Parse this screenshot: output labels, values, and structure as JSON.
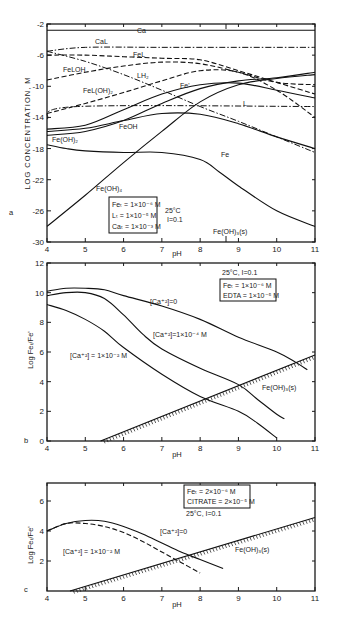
{
  "chart_data": [
    {
      "panel": "a",
      "type": "line",
      "xlabel": "pH",
      "ylabel": "LOG CONCENTRATION, M",
      "xlim": [
        4,
        11
      ],
      "ylim": [
        -30,
        -2
      ],
      "xticks": [
        "4",
        "5",
        "6",
        "7",
        "8",
        "9",
        "10",
        "11"
      ],
      "yticks": [
        "-2",
        "-6",
        "-10",
        "-14",
        "-18",
        "-22",
        "-26",
        "-30"
      ],
      "annotation_box": [
        "Fe_T = 1×10^-6 M",
        "L_T = 1×10^-5 M",
        "Ca_T = 1×10^-3 M"
      ],
      "conditions": [
        "25°C",
        "I=0.1"
      ],
      "marker": {
        "label": "Fe(OH)3(s)",
        "x": 8.6
      },
      "series": [
        {
          "name": "Ca",
          "style": "solid",
          "x": [
            4,
            11
          ],
          "y": [
            -2.8,
            -2.8
          ]
        },
        {
          "name": "CaL",
          "style": "dashdot",
          "x": [
            4,
            5,
            7,
            9,
            11
          ],
          "y": [
            -5.5,
            -5.0,
            -5.0,
            -5.0,
            -5.0
          ]
        },
        {
          "name": "FeL",
          "style": "dash",
          "x": [
            4,
            5,
            6,
            7,
            8,
            9,
            10,
            11
          ],
          "y": [
            -6,
            -6,
            -6.2,
            -6.4,
            -6.6,
            -8,
            -9.5,
            -11
          ]
        },
        {
          "name": "FeLOH",
          "style": "dash",
          "x": [
            4,
            5,
            6,
            7,
            8,
            9,
            10,
            11
          ],
          "y": [
            -9.2,
            -8.2,
            -7.4,
            -6.9,
            -7.1,
            -8.2,
            -9.5,
            -9.8
          ]
        },
        {
          "name": "LH2",
          "style": "dashdot",
          "x": [
            4,
            5,
            6,
            7,
            8,
            9,
            10,
            11
          ],
          "y": [
            -5.5,
            -6.8,
            -8.5,
            -10.5,
            -12.6,
            -14.5,
            -16.5,
            -18.5
          ]
        },
        {
          "name": "FeL(OH)2",
          "style": "dash",
          "x": [
            4,
            5,
            6,
            7,
            8,
            9,
            10,
            11
          ],
          "y": [
            -13.5,
            -12.2,
            -10.8,
            -9.3,
            -8,
            -8.2,
            -10.5,
            -14
          ]
        },
        {
          "name": "L",
          "style": "dashdot",
          "x": [
            4,
            4.8,
            11
          ],
          "y": [
            -14.2,
            -12.6,
            -12.6
          ]
        },
        {
          "name": "Fe'",
          "style": "solid",
          "x": [
            4,
            5,
            6,
            7,
            8,
            9,
            10,
            11
          ],
          "y": [
            -15.5,
            -15,
            -13,
            -11,
            -9.8,
            -9.6,
            -10.5,
            -11.5
          ]
        },
        {
          "name": "FeOH",
          "style": "solid",
          "x": [
            4,
            5,
            6,
            7,
            8,
            9,
            10,
            11
          ],
          "y": [
            -15.8,
            -15.4,
            -14.4,
            -13.5,
            -13.6,
            -14.8,
            -16.5,
            -18
          ]
        },
        {
          "name": "Fe(OH)2",
          "style": "solid",
          "x": [
            4,
            5,
            6,
            7,
            8,
            9,
            10,
            11
          ],
          "y": [
            -16.3,
            -15.8,
            -14.4,
            -12.2,
            -10.3,
            -9.3,
            -8.9,
            -8.2
          ]
        },
        {
          "name": "Fe",
          "style": "solid",
          "x": [
            4,
            4.5,
            5,
            6,
            7,
            8,
            8.5,
            9,
            10,
            11
          ],
          "y": [
            -17.5,
            -18,
            -18.3,
            -18.5,
            -18.5,
            -19.4,
            -21,
            -22.8,
            -26,
            -28
          ]
        },
        {
          "name": "Fe(OH)4",
          "style": "solid",
          "x": [
            4,
            5,
            6,
            7,
            8,
            9,
            10,
            11
          ],
          "y": [
            -28,
            -24,
            -19.8,
            -15.8,
            -12,
            -9.8,
            -9,
            -8.5
          ]
        }
      ]
    },
    {
      "panel": "b",
      "type": "line",
      "xlabel": "pH",
      "ylabel": "Log Fe_T/Fe'",
      "xlim": [
        4,
        11
      ],
      "ylim": [
        0,
        12
      ],
      "xticks": [
        "4",
        "5",
        "6",
        "7",
        "8",
        "9",
        "10",
        "11"
      ],
      "yticks": [
        "0",
        "2",
        "4",
        "6",
        "8",
        "10",
        "12"
      ],
      "conditions": "25°C, I=0.1",
      "annotation_box": [
        "Fe_T = 1×10^-6 M",
        "EDTA = 1×10^-5 M"
      ],
      "series": [
        {
          "name": "[Ca+2]=0",
          "style": "solid",
          "x": [
            4,
            4.5,
            5,
            5.5,
            6,
            7,
            8,
            9,
            10,
            10.5,
            10.8
          ],
          "y": [
            10.1,
            10.3,
            10.3,
            10.2,
            9.8,
            9.1,
            8.2,
            7.0,
            6.0,
            5.3,
            4.8
          ]
        },
        {
          "name": "[Ca+2]=1×10^-4 M",
          "style": "solid",
          "x": [
            4,
            4.5,
            5,
            5.5,
            6,
            6.5,
            7,
            8,
            9,
            9.5,
            10,
            10.2
          ],
          "y": [
            9.8,
            10.0,
            10.0,
            9.6,
            8.5,
            7.2,
            6.2,
            4.9,
            3.8,
            2.8,
            1.8,
            1.5
          ]
        },
        {
          "name": "[Ca+2]=1×10^-2 M",
          "style": "solid",
          "x": [
            4,
            4.5,
            5,
            5.5,
            6,
            7,
            8,
            9,
            9.5,
            10
          ],
          "y": [
            9.2,
            8.8,
            8.2,
            7.4,
            6.3,
            4.5,
            3.0,
            2.0,
            1.2,
            0.2
          ]
        },
        {
          "name": "Fe(OH)3(s)",
          "style": "hatched",
          "x": [
            5.4,
            11
          ],
          "y": [
            0,
            5.8
          ]
        }
      ]
    },
    {
      "panel": "c",
      "type": "line",
      "xlabel": "pH",
      "ylabel": "Log Fe_T/Fe'",
      "xlim": [
        4,
        11
      ],
      "ylim": [
        0,
        7.2
      ],
      "xticks": [
        "4",
        "5",
        "6",
        "7",
        "8",
        "9",
        "10",
        "11"
      ],
      "yticks": [
        "2",
        "4",
        "6"
      ],
      "annotation_box": [
        "Fe_T = 2×10^-6 M",
        "CITRATE = 2×10^-5 M"
      ],
      "conditions": "25°C, I=0.1",
      "series": [
        {
          "name": "[Ca+2]=0",
          "style": "solid",
          "x": [
            4,
            4.5,
            5,
            5.5,
            6,
            6.5,
            7,
            7.5,
            8,
            8.6
          ],
          "y": [
            4.0,
            4.5,
            4.7,
            4.65,
            4.3,
            3.8,
            3.2,
            2.6,
            2.1,
            1.5
          ]
        },
        {
          "name": "[Ca+2]=1×10^-2 M",
          "style": "dash",
          "x": [
            4,
            4.5,
            5,
            5.5,
            6,
            6.5,
            7,
            7.5,
            8
          ],
          "y": [
            4.0,
            4.5,
            4.5,
            4.3,
            3.9,
            3.3,
            2.6,
            1.9,
            1.2
          ]
        },
        {
          "name": "Fe(OH)3(s)",
          "style": "hatched",
          "x": [
            4.6,
            11
          ],
          "y": [
            0,
            4.9
          ]
        }
      ]
    }
  ],
  "panels": {
    "a": {
      "letter": "a",
      "ylabel": "LOG CONCENTRATION, M",
      "xlabel": "pH",
      "box_lines": [
        "Feₜ = 1×10⁻⁶ M",
        "Lₜ = 1×10⁻⁵ M",
        "Caₜ = 1×10⁻³ M"
      ],
      "temp": "25°C",
      "ionic": "I=0.1",
      "marker_label": "Fe(OH)₃(s)",
      "labels": {
        "ca": "Ca",
        "cal": "CaL",
        "fel": "FeL",
        "feloh": "FeLOH",
        "lh2": "LH₂",
        "feloh2": "FeL(OH)₂",
        "feprime": "Fe'",
        "l": "L",
        "feoh": "FeOH",
        "feoh2": "Fe(OH)₂",
        "fe": "Fe",
        "feoh4": "Fe(OH)₄"
      }
    },
    "b": {
      "letter": "b",
      "ylabel": "Log Feₜ/Fe'",
      "xlabel": "pH",
      "conditions": "25°C, I=0.1",
      "box_lines": [
        "Feₜ = 1×10⁻⁶ M",
        "EDTA = 1×10⁻⁵ M"
      ],
      "labels": {
        "ca0": "[Ca⁺²]=0",
        "ca4": "[Ca⁺²]=1×10⁻⁴ M",
        "ca2": "[Ca⁺²] = 1×10⁻² M",
        "feoh3": "Fe(OH)₃(s)"
      }
    },
    "c": {
      "letter": "c",
      "ylabel": "Log Feₜ/Fe'",
      "xlabel": "pH",
      "conditions": "25°C, I=0.1",
      "box_lines": [
        "Feₜ = 2×10⁻⁶ M",
        "CITRATE = 2×10⁻⁵ M"
      ],
      "labels": {
        "ca0": "[Ca⁺²]=0",
        "ca2": "[Ca⁺²] = 1×10⁻² M",
        "feoh3": "Fe(OH)₃(s)"
      }
    }
  }
}
